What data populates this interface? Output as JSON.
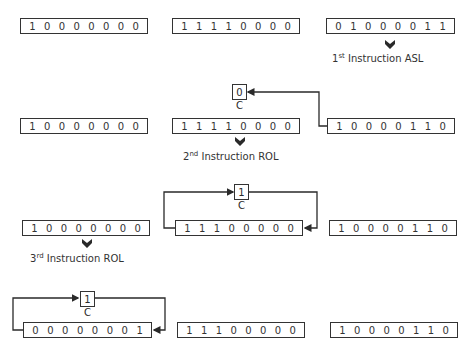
{
  "rows": [
    {
      "registers": [
        {
          "bits": [
            "1",
            "0",
            "0",
            "0",
            "0",
            "0",
            "0",
            "0"
          ]
        },
        {
          "bits": [
            "1",
            "1",
            "1",
            "1",
            "0",
            "0",
            "0",
            "0"
          ]
        },
        {
          "bits": [
            "0",
            "1",
            "0",
            "0",
            "0",
            "0",
            "1",
            "1"
          ]
        }
      ],
      "instruction": {
        "ordinal": "1",
        "suffix": "st",
        "text": "Instruction ASL"
      }
    },
    {
      "carry": {
        "value": "0",
        "label": "C"
      },
      "registers": [
        {
          "bits": [
            "1",
            "0",
            "0",
            "0",
            "0",
            "0",
            "0",
            "0"
          ]
        },
        {
          "bits": [
            "1",
            "1",
            "1",
            "1",
            "0",
            "0",
            "0",
            "0"
          ]
        },
        {
          "bits": [
            "1",
            "0",
            "0",
            "0",
            "0",
            "1",
            "1",
            "0"
          ]
        }
      ],
      "instruction": {
        "ordinal": "2",
        "suffix": "nd",
        "text": "Instruction ROL"
      }
    },
    {
      "carry": {
        "value": "1",
        "label": "C"
      },
      "registers": [
        {
          "bits": [
            "1",
            "0",
            "0",
            "0",
            "0",
            "0",
            "0",
            "0"
          ]
        },
        {
          "bits": [
            "1",
            "1",
            "1",
            "0",
            "0",
            "0",
            "0",
            "0"
          ]
        },
        {
          "bits": [
            "1",
            "0",
            "0",
            "0",
            "0",
            "1",
            "1",
            "0"
          ]
        }
      ],
      "instruction": {
        "ordinal": "3",
        "suffix": "rd",
        "text": "Instruction ROL"
      }
    },
    {
      "carry": {
        "value": "1",
        "label": "C"
      },
      "registers": [
        {
          "bits": [
            "0",
            "0",
            "0",
            "0",
            "0",
            "0",
            "0",
            "1"
          ]
        },
        {
          "bits": [
            "1",
            "1",
            "1",
            "0",
            "0",
            "0",
            "0",
            "0"
          ]
        },
        {
          "bits": [
            "1",
            "0",
            "0",
            "0",
            "0",
            "1",
            "1",
            "0"
          ]
        }
      ]
    }
  ],
  "colors": {
    "line": "#2a2a2a",
    "background": "#ffffff"
  }
}
